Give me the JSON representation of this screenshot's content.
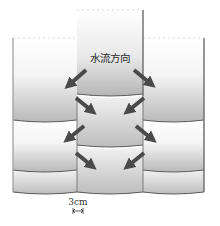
{
  "diagram": {
    "title_label": "水流方向",
    "dimension_label": "3cm",
    "colors": {
      "block_top": "#ffffff",
      "block_bottom": "#b8b8b8",
      "edge": "#6a6a6a",
      "seam": "#5a5a5a",
      "arrow": "#4a4a4a",
      "background": "#ffffff"
    },
    "arrows": [
      {
        "name": "arrow-top-left",
        "direction": "down-left"
      },
      {
        "name": "arrow-top-right",
        "direction": "down-right"
      },
      {
        "name": "arrow-mid-left-inward",
        "direction": "down-right"
      },
      {
        "name": "arrow-mid-right-inward",
        "direction": "down-left"
      },
      {
        "name": "arrow-mid-left-outward",
        "direction": "down-left"
      },
      {
        "name": "arrow-mid-right-outward",
        "direction": "down-right"
      },
      {
        "name": "arrow-bottom-left-inward",
        "direction": "down-right"
      },
      {
        "name": "arrow-bottom-right-inward",
        "direction": "down-left"
      }
    ],
    "columns": [
      "left",
      "center",
      "right"
    ],
    "rows": 4
  }
}
